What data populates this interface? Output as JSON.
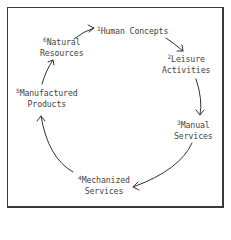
{
  "diagram": {
    "type": "cycle",
    "direction": "clockwise",
    "nodes": [
      {
        "number": "1",
        "line1": "Human Concepts",
        "line2": ""
      },
      {
        "number": "2",
        "line1": "Leisure",
        "line2": "Activities"
      },
      {
        "number": "3",
        "line1": "Manual",
        "line2": "Services"
      },
      {
        "number": "4",
        "line1": "Mechanized",
        "line2": "Services"
      },
      {
        "number": "5",
        "line1": "Manufactured",
        "line2": "Products"
      },
      {
        "number": "6",
        "line1": "Natural",
        "line2": "Resources"
      }
    ],
    "edges": [
      {
        "from": "1",
        "to": "2"
      },
      {
        "from": "2",
        "to": "3"
      },
      {
        "from": "3",
        "to": "4"
      },
      {
        "from": "4",
        "to": "5"
      },
      {
        "from": "5",
        "to": "6"
      },
      {
        "from": "6",
        "to": "1"
      }
    ],
    "colors": {
      "text": "#444444",
      "stroke": "#333333",
      "frame": "#3a3a3a",
      "background": "#ffffff"
    }
  }
}
